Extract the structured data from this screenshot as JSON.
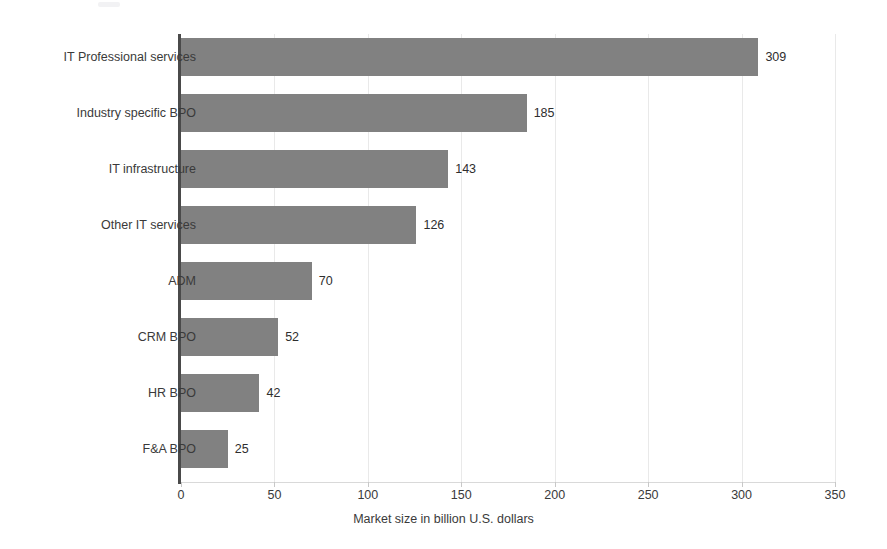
{
  "chart_data": {
    "type": "bar",
    "orientation": "horizontal",
    "title": "",
    "subtitle": "",
    "xlabel": "Market size in billion U.S. dollars",
    "ylabel": "",
    "xlim": [
      0,
      350
    ],
    "xticks": [
      0,
      50,
      100,
      150,
      200,
      250,
      300,
      350
    ],
    "xtick_labels": [
      "0",
      "50",
      "100",
      "150",
      "200",
      "250",
      "300",
      "350"
    ],
    "grid": true,
    "grid_axis": "x",
    "legend": false,
    "legend_position": "none",
    "bar_color": "#818181",
    "categories": [
      "IT Professional services",
      "Industry specific BPO",
      "IT infrastructure",
      "Other IT services",
      "ADM",
      "CRM BPO",
      "HR BPO",
      "F&A BPO"
    ],
    "values": [
      309,
      185,
      143,
      126,
      70,
      52,
      42,
      25
    ],
    "value_labels": [
      "309",
      "185",
      "143",
      "126",
      "70",
      "52",
      "42",
      "25"
    ]
  },
  "colors": {
    "bar": "#818181",
    "axis": "#4a4a4a",
    "grid": "#e9e9e9",
    "text": "#3a3a3a",
    "background": "#ffffff"
  }
}
